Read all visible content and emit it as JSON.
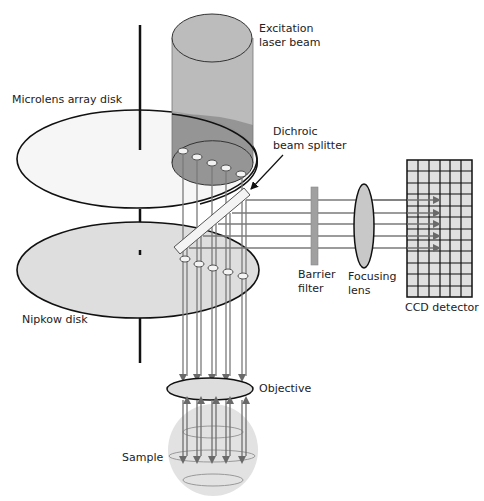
{
  "labels": {
    "excitation_line1": "Excitation",
    "excitation_line2": "laser beam",
    "microlens_disk": "Microlens array disk",
    "dichroic_line1": "Dichroic",
    "dichroic_line2": "beam splitter",
    "barrier_line1": "Barrier",
    "barrier_line2": "filter",
    "focusing_line1": "Focusing",
    "focusing_line2": "lens",
    "ccd_detector": "CCD detector",
    "nipkow_disk": "Nipkow disk",
    "objective": "Objective",
    "sample": "Sample"
  },
  "colors": {
    "laser_beam": "#b4b4b4",
    "microlens_disk": "#f6f6f6",
    "nipkow_disk": "#dedede",
    "ray": "#7a7a7a",
    "filter": "#a0a0a0",
    "lens": "#c8c8c8",
    "ccd_cell": "#e0e0e0",
    "outline": "#111111"
  },
  "geometry": {
    "ray_columns": [
      183,
      197,
      212,
      226,
      241
    ],
    "ray_rows_y": [
      200,
      213,
      224,
      236,
      248
    ],
    "ccd_grid": {
      "cols": 6,
      "rows": 12
    }
  }
}
